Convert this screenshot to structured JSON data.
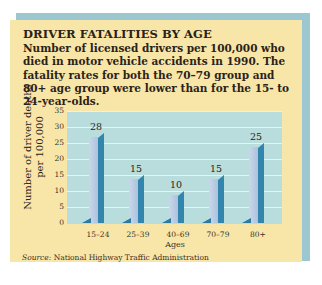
{
  "figure": {
    "title": "DRIVER FATALITIES BY AGE",
    "description": "Number of licensed drivers per 100,000 who died in motor vehicle accidents in 1990. The fatality rates for both the 70–79 group and 80+ age group were lower than for the 15- to 24-year-olds.",
    "source_label": "Source:",
    "source_text": " National Highway Traffic Administration"
  },
  "colors": {
    "panel_bg": "#f8e6a8",
    "frame_blue": "#9cc7d1",
    "plot_bg": "#b9dcdc",
    "bar_front": "#bccde3",
    "bar_side": "#3286ad"
  },
  "chart_data": {
    "type": "bar",
    "title": "DRIVER FATALITIES BY AGE",
    "subtitle": "Number of licensed drivers per 100,000 who died in motor vehicle accidents in 1990. The fatality rates for both the 70–79 group and 80+ age group were lower than for the 15- to 24-year-olds.",
    "categories": [
      "15–24",
      "25–39",
      "40–69",
      "70–79",
      "80+"
    ],
    "values": [
      28,
      15,
      10,
      15,
      25
    ],
    "xlabel": "Ages",
    "ylabel": "Number of driver deaths per 100,000",
    "ylim": [
      0,
      35
    ],
    "yticks": [
      "0",
      "5",
      "10",
      "15",
      "20",
      "25",
      "30",
      "35"
    ],
    "grid": true,
    "legend": null,
    "data_labels": [
      "28",
      "15",
      "10",
      "15",
      "25"
    ],
    "annotations": [
      "Source: National Highway Traffic Administration"
    ]
  }
}
